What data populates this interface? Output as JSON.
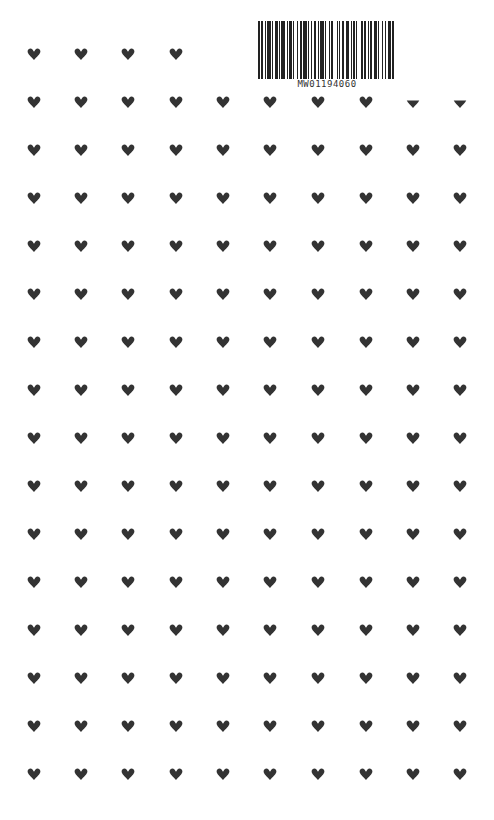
{
  "barcode": {
    "text": "MW01194060",
    "pattern": [
      2,
      1,
      1,
      2,
      1,
      1,
      3,
      1,
      1,
      2,
      2,
      1,
      1,
      1,
      3,
      2,
      1,
      1,
      2,
      1,
      1,
      3,
      1,
      1,
      2,
      1,
      3,
      1,
      1,
      2,
      1,
      1,
      2,
      2,
      1,
      1,
      3,
      1,
      1,
      2,
      1,
      1,
      2,
      3,
      1,
      1,
      1,
      2,
      1,
      2,
      3,
      1,
      1,
      1,
      2,
      1,
      1,
      3,
      2,
      1,
      1,
      2,
      1,
      1,
      2,
      1,
      3,
      1,
      1,
      2,
      1,
      2,
      1,
      1,
      3,
      1,
      2
    ]
  },
  "pattern": {
    "icon": "heart-icon",
    "color": "#333333",
    "columns_x": [
      34,
      81,
      128,
      176,
      223,
      270,
      318,
      366,
      413,
      460
    ],
    "rows_y": [
      54,
      102,
      150,
      198,
      246,
      294,
      342,
      390,
      438,
      486,
      534,
      582,
      630,
      678,
      726,
      774
    ],
    "first_row_columns": 4,
    "clipped_cells": [
      [
        1,
        8
      ],
      [
        1,
        9
      ]
    ]
  }
}
